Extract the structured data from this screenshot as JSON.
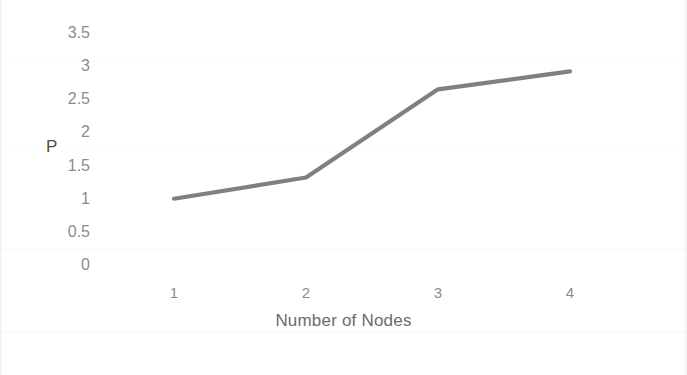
{
  "chart_data": {
    "type": "line",
    "title": "",
    "xlabel": "Number of Nodes",
    "ylabel": "P",
    "categories": [
      "1",
      "2",
      "3",
      "4"
    ],
    "x": [
      1,
      2,
      3,
      4
    ],
    "values": [
      1,
      1.32,
      2.65,
      2.92
    ],
    "series": [
      {
        "name": "P",
        "values": [
          1,
          1.32,
          2.65,
          2.92
        ],
        "color": "#808080"
      }
    ],
    "ylim": [
      0,
      3.5
    ],
    "ytick_labels": [
      "3.5",
      "3",
      "2.5",
      "2",
      "1.5",
      "1",
      "0.5",
      "0"
    ],
    "ytick_values": [
      3.5,
      3,
      2.5,
      2,
      1.5,
      1,
      0.5,
      0
    ],
    "xtick_labels": [
      "1",
      "2",
      "3",
      "4"
    ],
    "grid": false,
    "legend": false,
    "legend_position": "none",
    "line_color": "#808080",
    "tick_label_color": "#8c8c8c",
    "axis_title_color": "#6b6b6b",
    "background_color": "#ffffff"
  }
}
